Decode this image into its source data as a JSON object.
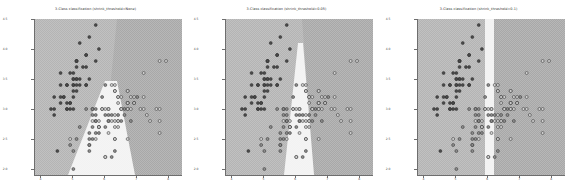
{
  "figure": {
    "background": "#ffffff",
    "width": 574,
    "height": 193,
    "panel_count": 3
  },
  "colors": {
    "region_left": "#b4b4b4",
    "region_right": "#a8a8a8",
    "region_middle": "#f2f2f2",
    "class_0_marker": "#4a4a4a",
    "class_1_marker": "#8c8c8c",
    "class_2_marker": "#d0d0d0",
    "marker_edge": "#2e2e2e",
    "axis": "#6e6e6e",
    "tick_label": "#4a4a4a",
    "title": "#2b2b2b"
  },
  "panels": [
    {
      "title": "3-Class classification (shrink_threshold=None)",
      "shrink_threshold": "None",
      "xticks": [
        "4",
        "5",
        "6",
        "7",
        "8"
      ],
      "yticks": [
        "2.0",
        "2.5",
        "3.0",
        "3.5",
        "4.0",
        "4.5"
      ],
      "xlim": [
        3.8,
        8.4
      ],
      "ylim": [
        1.9,
        4.5
      ],
      "xlabel": "",
      "ylabel": "",
      "boundary_style": "wedge",
      "boundary_note": "Left region meets right region along a descending curve; a pale wedge opens downward from the centre."
    },
    {
      "title": "3-Class classification (shrink_threshold=0.05)",
      "shrink_threshold": "0.05",
      "xticks": [
        "4",
        "5",
        "6",
        "7",
        "8"
      ],
      "yticks": [
        "2.0",
        "2.5",
        "3.0",
        "3.5",
        "4.0",
        "4.5"
      ],
      "xlim": [
        3.8,
        8.4
      ],
      "ylim": [
        1.9,
        4.5
      ],
      "xlabel": "",
      "ylabel": "",
      "boundary_style": "narrow-wedge",
      "boundary_note": "Narrow near-vertical pale wedge widening toward the bottom."
    },
    {
      "title": "3-Class classification (shrink_threshold=0.1)",
      "shrink_threshold": "0.1",
      "xticks": [
        "4",
        "5",
        "6",
        "7",
        "8"
      ],
      "yticks": [
        "2.0",
        "2.5",
        "3.0",
        "3.5",
        "4.0",
        "4.5"
      ],
      "xlim": [
        3.8,
        8.4
      ],
      "ylim": [
        1.9,
        4.5
      ],
      "xlabel": "",
      "ylabel": "",
      "boundary_style": "vertical-band",
      "boundary_note": "Straight vertical pale band separating left and right regions."
    }
  ],
  "chart_data": {
    "type": "scatter",
    "xlabel": "",
    "ylabel": "",
    "xlim": [
      3.8,
      8.4
    ],
    "ylim": [
      1.9,
      4.5
    ],
    "grid": false,
    "legend": "none",
    "classes": [
      "0",
      "1",
      "2"
    ],
    "subplots": [
      {
        "title": "3-Class classification (shrink_threshold=None)",
        "shrink_threshold": "None"
      },
      {
        "title": "3-Class classification (shrink_threshold=0.05)",
        "shrink_threshold": "0.05"
      },
      {
        "title": "3-Class classification (shrink_threshold=0.1)",
        "shrink_threshold": "0.1"
      }
    ],
    "points": [
      {
        "x": 5.1,
        "y": 3.5,
        "c": 0
      },
      {
        "x": 4.9,
        "y": 3.0,
        "c": 0
      },
      {
        "x": 4.7,
        "y": 3.2,
        "c": 0
      },
      {
        "x": 4.6,
        "y": 3.1,
        "c": 0
      },
      {
        "x": 5.0,
        "y": 3.6,
        "c": 0
      },
      {
        "x": 5.4,
        "y": 3.9,
        "c": 0
      },
      {
        "x": 4.6,
        "y": 3.4,
        "c": 0
      },
      {
        "x": 5.0,
        "y": 3.4,
        "c": 0
      },
      {
        "x": 4.4,
        "y": 2.9,
        "c": 0
      },
      {
        "x": 4.9,
        "y": 3.1,
        "c": 0
      },
      {
        "x": 5.4,
        "y": 3.7,
        "c": 0
      },
      {
        "x": 4.8,
        "y": 3.4,
        "c": 0
      },
      {
        "x": 4.8,
        "y": 3.0,
        "c": 0
      },
      {
        "x": 4.3,
        "y": 3.0,
        "c": 0
      },
      {
        "x": 5.8,
        "y": 4.0,
        "c": 0
      },
      {
        "x": 5.7,
        "y": 4.4,
        "c": 0
      },
      {
        "x": 5.4,
        "y": 3.9,
        "c": 0
      },
      {
        "x": 5.1,
        "y": 3.5,
        "c": 0
      },
      {
        "x": 5.7,
        "y": 3.8,
        "c": 0
      },
      {
        "x": 5.1,
        "y": 3.8,
        "c": 0
      },
      {
        "x": 5.4,
        "y": 3.4,
        "c": 0
      },
      {
        "x": 5.1,
        "y": 3.7,
        "c": 0
      },
      {
        "x": 4.6,
        "y": 3.6,
        "c": 0
      },
      {
        "x": 5.1,
        "y": 3.3,
        "c": 0
      },
      {
        "x": 4.8,
        "y": 3.4,
        "c": 0
      },
      {
        "x": 5.0,
        "y": 3.0,
        "c": 0
      },
      {
        "x": 5.0,
        "y": 3.4,
        "c": 0
      },
      {
        "x": 5.2,
        "y": 3.5,
        "c": 0
      },
      {
        "x": 5.2,
        "y": 3.4,
        "c": 0
      },
      {
        "x": 4.7,
        "y": 3.2,
        "c": 0
      },
      {
        "x": 4.8,
        "y": 3.1,
        "c": 0
      },
      {
        "x": 5.4,
        "y": 3.4,
        "c": 0
      },
      {
        "x": 5.2,
        "y": 4.1,
        "c": 0
      },
      {
        "x": 5.5,
        "y": 4.2,
        "c": 0
      },
      {
        "x": 4.9,
        "y": 3.1,
        "c": 0
      },
      {
        "x": 5.0,
        "y": 3.2,
        "c": 0
      },
      {
        "x": 5.5,
        "y": 3.5,
        "c": 0
      },
      {
        "x": 4.9,
        "y": 3.6,
        "c": 0
      },
      {
        "x": 4.4,
        "y": 3.0,
        "c": 0
      },
      {
        "x": 5.1,
        "y": 3.4,
        "c": 0
      },
      {
        "x": 5.0,
        "y": 3.5,
        "c": 0
      },
      {
        "x": 4.5,
        "y": 2.3,
        "c": 0
      },
      {
        "x": 4.4,
        "y": 3.2,
        "c": 0
      },
      {
        "x": 5.0,
        "y": 3.5,
        "c": 0
      },
      {
        "x": 5.1,
        "y": 3.8,
        "c": 0
      },
      {
        "x": 4.8,
        "y": 3.0,
        "c": 0
      },
      {
        "x": 5.1,
        "y": 3.8,
        "c": 0
      },
      {
        "x": 4.6,
        "y": 3.2,
        "c": 0
      },
      {
        "x": 5.3,
        "y": 3.7,
        "c": 0
      },
      {
        "x": 5.0,
        "y": 3.3,
        "c": 0
      },
      {
        "x": 7.0,
        "y": 3.2,
        "c": 1
      },
      {
        "x": 6.4,
        "y": 3.2,
        "c": 1
      },
      {
        "x": 6.9,
        "y": 3.1,
        "c": 1
      },
      {
        "x": 5.5,
        "y": 2.3,
        "c": 1
      },
      {
        "x": 6.5,
        "y": 2.8,
        "c": 1
      },
      {
        "x": 5.7,
        "y": 2.8,
        "c": 1
      },
      {
        "x": 6.3,
        "y": 3.3,
        "c": 1
      },
      {
        "x": 4.9,
        "y": 2.4,
        "c": 1
      },
      {
        "x": 6.6,
        "y": 2.9,
        "c": 1
      },
      {
        "x": 5.2,
        "y": 2.7,
        "c": 1
      },
      {
        "x": 5.0,
        "y": 2.0,
        "c": 1
      },
      {
        "x": 5.9,
        "y": 3.0,
        "c": 1
      },
      {
        "x": 6.0,
        "y": 2.2,
        "c": 1
      },
      {
        "x": 6.1,
        "y": 2.9,
        "c": 1
      },
      {
        "x": 5.6,
        "y": 2.9,
        "c": 1
      },
      {
        "x": 6.7,
        "y": 3.1,
        "c": 1
      },
      {
        "x": 5.6,
        "y": 3.0,
        "c": 1
      },
      {
        "x": 5.8,
        "y": 2.7,
        "c": 1
      },
      {
        "x": 6.2,
        "y": 2.2,
        "c": 1
      },
      {
        "x": 5.6,
        "y": 2.5,
        "c": 1
      },
      {
        "x": 5.9,
        "y": 3.2,
        "c": 1
      },
      {
        "x": 6.1,
        "y": 2.8,
        "c": 1
      },
      {
        "x": 6.3,
        "y": 2.5,
        "c": 1
      },
      {
        "x": 6.1,
        "y": 2.8,
        "c": 1
      },
      {
        "x": 6.4,
        "y": 2.9,
        "c": 1
      },
      {
        "x": 6.6,
        "y": 3.0,
        "c": 1
      },
      {
        "x": 6.8,
        "y": 2.8,
        "c": 1
      },
      {
        "x": 6.7,
        "y": 3.0,
        "c": 1
      },
      {
        "x": 6.0,
        "y": 2.9,
        "c": 1
      },
      {
        "x": 5.7,
        "y": 2.6,
        "c": 1
      },
      {
        "x": 5.5,
        "y": 2.4,
        "c": 1
      },
      {
        "x": 5.5,
        "y": 2.4,
        "c": 1
      },
      {
        "x": 5.8,
        "y": 2.7,
        "c": 1
      },
      {
        "x": 6.0,
        "y": 2.7,
        "c": 1
      },
      {
        "x": 5.4,
        "y": 3.0,
        "c": 1
      },
      {
        "x": 6.0,
        "y": 3.4,
        "c": 1
      },
      {
        "x": 6.7,
        "y": 3.1,
        "c": 1
      },
      {
        "x": 6.3,
        "y": 2.3,
        "c": 1
      },
      {
        "x": 5.6,
        "y": 3.0,
        "c": 1
      },
      {
        "x": 5.5,
        "y": 2.5,
        "c": 1
      },
      {
        "x": 5.5,
        "y": 2.6,
        "c": 1
      },
      {
        "x": 6.1,
        "y": 3.0,
        "c": 1
      },
      {
        "x": 5.8,
        "y": 2.6,
        "c": 1
      },
      {
        "x": 5.0,
        "y": 2.3,
        "c": 1
      },
      {
        "x": 5.6,
        "y": 2.7,
        "c": 1
      },
      {
        "x": 5.7,
        "y": 3.0,
        "c": 1
      },
      {
        "x": 5.7,
        "y": 2.9,
        "c": 1
      },
      {
        "x": 6.2,
        "y": 2.9,
        "c": 1
      },
      {
        "x": 5.1,
        "y": 2.5,
        "c": 1
      },
      {
        "x": 5.7,
        "y": 2.8,
        "c": 1
      },
      {
        "x": 6.3,
        "y": 3.3,
        "c": 2
      },
      {
        "x": 5.8,
        "y": 2.7,
        "c": 2
      },
      {
        "x": 7.1,
        "y": 3.0,
        "c": 2
      },
      {
        "x": 6.3,
        "y": 2.9,
        "c": 2
      },
      {
        "x": 6.5,
        "y": 3.0,
        "c": 2
      },
      {
        "x": 7.6,
        "y": 3.0,
        "c": 2
      },
      {
        "x": 4.9,
        "y": 2.5,
        "c": 2
      },
      {
        "x": 7.3,
        "y": 2.9,
        "c": 2
      },
      {
        "x": 6.7,
        "y": 2.5,
        "c": 2
      },
      {
        "x": 7.2,
        "y": 3.6,
        "c": 2
      },
      {
        "x": 6.5,
        "y": 3.2,
        "c": 2
      },
      {
        "x": 6.4,
        "y": 2.7,
        "c": 2
      },
      {
        "x": 6.8,
        "y": 3.0,
        "c": 2
      },
      {
        "x": 5.7,
        "y": 2.5,
        "c": 2
      },
      {
        "x": 5.8,
        "y": 2.8,
        "c": 2
      },
      {
        "x": 6.4,
        "y": 3.2,
        "c": 2
      },
      {
        "x": 6.5,
        "y": 3.0,
        "c": 2
      },
      {
        "x": 7.7,
        "y": 3.8,
        "c": 2
      },
      {
        "x": 7.7,
        "y": 2.6,
        "c": 2
      },
      {
        "x": 6.0,
        "y": 2.2,
        "c": 2
      },
      {
        "x": 6.9,
        "y": 3.2,
        "c": 2
      },
      {
        "x": 5.6,
        "y": 2.8,
        "c": 2
      },
      {
        "x": 7.7,
        "y": 2.8,
        "c": 2
      },
      {
        "x": 6.3,
        "y": 2.7,
        "c": 2
      },
      {
        "x": 6.7,
        "y": 3.3,
        "c": 2
      },
      {
        "x": 7.2,
        "y": 3.2,
        "c": 2
      },
      {
        "x": 6.2,
        "y": 2.8,
        "c": 2
      },
      {
        "x": 6.1,
        "y": 3.0,
        "c": 2
      },
      {
        "x": 6.4,
        "y": 2.8,
        "c": 2
      },
      {
        "x": 7.2,
        "y": 3.0,
        "c": 2
      },
      {
        "x": 7.4,
        "y": 2.8,
        "c": 2
      },
      {
        "x": 7.9,
        "y": 3.8,
        "c": 2
      },
      {
        "x": 6.4,
        "y": 2.8,
        "c": 2
      },
      {
        "x": 6.3,
        "y": 2.8,
        "c": 2
      },
      {
        "x": 6.1,
        "y": 2.6,
        "c": 2
      },
      {
        "x": 7.7,
        "y": 3.0,
        "c": 2
      },
      {
        "x": 6.3,
        "y": 3.4,
        "c": 2
      },
      {
        "x": 6.4,
        "y": 3.1,
        "c": 2
      },
      {
        "x": 6.0,
        "y": 3.0,
        "c": 2
      },
      {
        "x": 6.9,
        "y": 3.1,
        "c": 2
      },
      {
        "x": 6.7,
        "y": 3.1,
        "c": 2
      },
      {
        "x": 6.9,
        "y": 3.1,
        "c": 2
      },
      {
        "x": 5.8,
        "y": 2.7,
        "c": 2
      },
      {
        "x": 6.8,
        "y": 3.2,
        "c": 2
      },
      {
        "x": 6.7,
        "y": 3.3,
        "c": 2
      },
      {
        "x": 6.7,
        "y": 3.0,
        "c": 2
      },
      {
        "x": 6.3,
        "y": 2.5,
        "c": 2
      },
      {
        "x": 6.5,
        "y": 3.0,
        "c": 2
      },
      {
        "x": 6.2,
        "y": 3.4,
        "c": 2
      },
      {
        "x": 5.9,
        "y": 3.0,
        "c": 2
      }
    ]
  }
}
